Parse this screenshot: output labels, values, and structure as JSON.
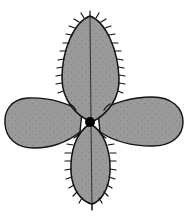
{
  "illustration": {
    "subject": "four-lobed leaf rosette with spiny margins",
    "colors": {
      "background": "#ffffff",
      "fill": "#9a9a9a",
      "outline": "#111111",
      "stipple": "#5a5a5a",
      "center": "#000000"
    },
    "center": {
      "x": 90,
      "y": 122
    }
  }
}
